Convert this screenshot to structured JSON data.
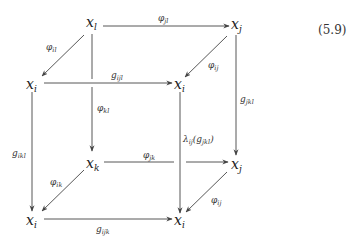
{
  "equation_number": "(5.9)",
  "nodes": {
    "back_top_left": {
      "base": "x",
      "sub": "l"
    },
    "back_top_right": {
      "base": "x",
      "sub": "j"
    },
    "front_top_left": {
      "base": "x",
      "sub": "i"
    },
    "front_top_right": {
      "base": "x",
      "sub": "i"
    },
    "back_bottom_left": {
      "base": "x",
      "sub": "k"
    },
    "back_bottom_right": {
      "base": "x",
      "sub": "j"
    },
    "front_bottom_left": {
      "base": "x",
      "sub": "i"
    },
    "front_bottom_right": {
      "base": "x",
      "sub": "i"
    }
  },
  "arrows": {
    "phi_jl": {
      "base": "φ",
      "sub": "jl"
    },
    "phi_il": {
      "base": "φ",
      "sub": "il"
    },
    "phi_ij_top": {
      "base": "φ",
      "sub": "ij"
    },
    "g_ijl": {
      "base": "g",
      "sub": "ijl"
    },
    "phi_kl": {
      "base": "φ",
      "sub": "kl"
    },
    "g_jkl": {
      "base": "g",
      "sub": "jkl"
    },
    "lambda": {
      "base": "λ",
      "sub": "ij",
      "rest_open": "(g",
      "rest_sub": "jkl",
      "rest_close": ")"
    },
    "g_ikl": {
      "base": "g",
      "sub": "ikl"
    },
    "phi_jk": {
      "base": "φ",
      "sub": "jk"
    },
    "phi_ik": {
      "base": "φ",
      "sub": "ik"
    },
    "phi_ij_bottom": {
      "base": "φ",
      "sub": "ij"
    },
    "g_ijk": {
      "base": "g",
      "sub": "ijk"
    }
  }
}
